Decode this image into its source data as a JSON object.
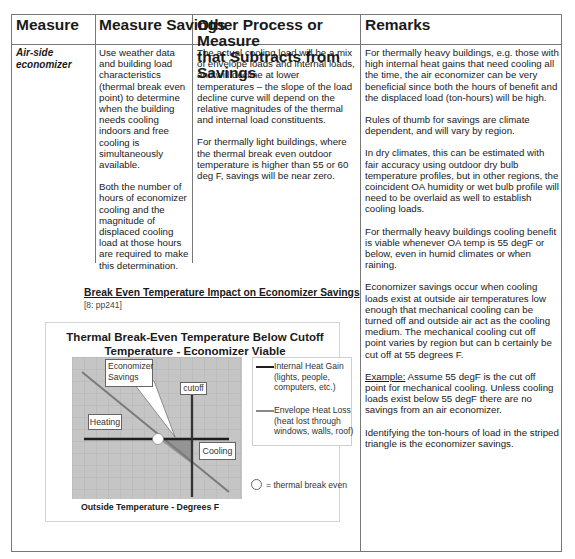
{
  "table": {
    "headers": [
      "Measure",
      "Measure Savings",
      "Other Process or Measure that Subtracts from Savings",
      "Remarks"
    ],
    "header_lines": {
      "col3_line1": "Other Process or Measure",
      "col3_line2": "that Subtracts from Savings"
    },
    "row": {
      "measure": "Air-side economizer",
      "measure_line1": "Air-side",
      "measure_line2": "economizer",
      "savings": [
        "Use weather data and building load characteristics (thermal break even point) to determine when the building needs cooling indoors and free cooling is simultaneously available.",
        "Both the number of hours of economizer cooling and the magnitude of displaced cooling load at those hours are required to make this determination."
      ],
      "subtracts": [
        "The actual cooling load will be a mix of envelope loads and internal loads, and will decline at lower temperatures – the slope of the load decline curve will depend on the relative magnitudes of the thermal and internal load constituents.",
        "For thermally light buildings, where the thermal break even outdoor temperature is higher than 55 or 60 deg F, savings will be near zero."
      ],
      "remarks": [
        "For thermally heavy buildings, e.g. those with high internal heat gains that need cooling all the time, the air economizer can be very beneficial since both the hours of benefit and the displaced load (ton-hours) will be high.",
        "Rules of thumb for savings are climate dependent, and will vary by region.",
        "In dry climates, this can be estimated with fair accuracy using outdoor dry bulb temperature profiles, but in other regions, the coincident OA humidity or wet bulb profile will need to be overlaid as well to establish cooling loads.",
        "For thermally heavy buildings cooling benefit is viable whenever OA temp is 55 degF or below, even in humid climates or when raining.",
        "Economizer savings occur when cooling loads exist at outside air temperatures low enough that mechanical cooling can be turned off and outside air act as the cooling medium.  The mechanical cooling cut off point varies by region but can b certainly be cut off at 55 degrees F."
      ],
      "remarks_example_label": "Example:",
      "remarks_example_text": "  Assume 55 degF is the cut off point for mechanical cooling. Unless cooling loads exist below 55 degF there are no savings from an air economizer.",
      "remarks_last": "Identifying the ton-hours of load in the striped triangle is the economizer savings."
    }
  },
  "figure": {
    "caption_title": "Break Even Temperature Impact on Economizer Savings",
    "caption_ref": "[8: pp241]",
    "chart_title_line1": "Thermal Break-Even Temperature Below Cutoff",
    "chart_title_line2": "Temperature - Economizer Viable",
    "labels": {
      "economizer_line1": "Economizer",
      "economizer_line2": "Savings",
      "cutoff": "cutoff",
      "heating": "Heating",
      "cooling": "Cooling"
    },
    "xlabel": "Outside Temperature - Degrees F",
    "legend": {
      "internal_line1": "Internal Heat Gain",
      "internal_line2": "(lights, people,",
      "internal_line3": "computers, etc.)",
      "envelope_line1": "Envelope Heat Loss",
      "envelope_line2": "(heat lost through",
      "envelope_line3": "windows, walls, roof)",
      "break_even": "= thermal break even"
    },
    "colors": {
      "plot_bg": "#c4c4c4",
      "grid": "#b0b0b0",
      "internal_line": "#1e1e1e",
      "envelope_line": "#7a7a7a",
      "savings_fill": "#8a8a8a"
    }
  }
}
